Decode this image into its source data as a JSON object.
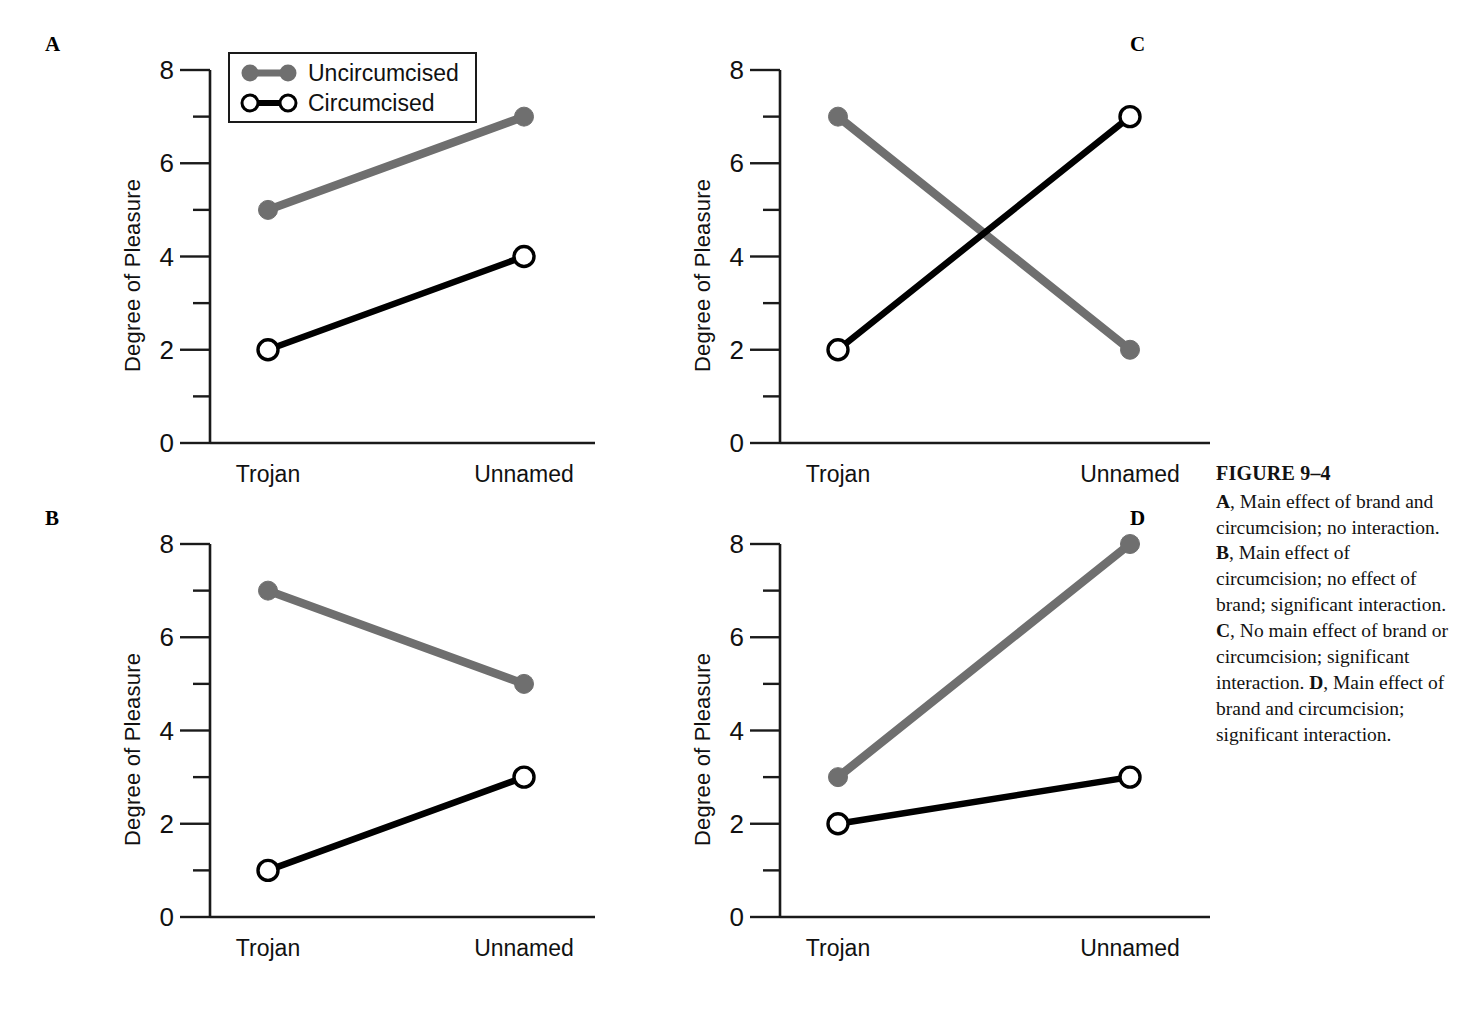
{
  "figure": {
    "caption_title": "FIGURE 9–4",
    "caption_items": [
      {
        "letter": "A",
        "text": ", Main effect of brand and circumcision; no interaction."
      },
      {
        "letter": "B",
        "text": ", Main effect of circumcision; no effect of brand; significant interaction."
      },
      {
        "letter": "C",
        "text": ", No main effect of brand or circumcision; significant interaction."
      },
      {
        "letter": "D",
        "text": ", Main effect of brand and circumcision; significant interaction."
      }
    ]
  },
  "legend": {
    "position": "top-left-inside-panel-A",
    "entries": [
      {
        "label": "Uncircumcised",
        "marker": "filled-circle",
        "color": "#6f6f6f"
      },
      {
        "label": "Circumcised",
        "marker": "open-circle",
        "color": "#000000"
      }
    ]
  },
  "colors": {
    "uncircumcised": "#6f6f6f",
    "circumcised": "#000000",
    "axis": "#1a1a1a",
    "background": "#ffffff"
  },
  "chart_data": [
    {
      "panel": "A",
      "type": "line",
      "title": "",
      "xlabel": "",
      "ylabel": "Degree of Pleasure",
      "categories": [
        "Trojan",
        "Unnamed"
      ],
      "ylim": [
        0,
        8
      ],
      "yticks": [
        0,
        2,
        4,
        6,
        8
      ],
      "yticks_minor": [
        1,
        3,
        5,
        7
      ],
      "grid": false,
      "legend_position": "upper left",
      "series": [
        {
          "name": "Uncircumcised",
          "values": [
            5,
            7
          ],
          "color": "#6f6f6f",
          "marker": "filled-circle"
        },
        {
          "name": "Circumcised",
          "values": [
            2,
            4
          ],
          "color": "#000000",
          "marker": "open-circle"
        }
      ]
    },
    {
      "panel": "B",
      "type": "line",
      "title": "",
      "xlabel": "",
      "ylabel": "Degree of Pleasure",
      "categories": [
        "Trojan",
        "Unnamed"
      ],
      "ylim": [
        0,
        8
      ],
      "yticks": [
        0,
        2,
        4,
        6,
        8
      ],
      "yticks_minor": [
        1,
        3,
        5,
        7
      ],
      "grid": false,
      "legend_position": "none",
      "series": [
        {
          "name": "Uncircumcised",
          "values": [
            7,
            5
          ],
          "color": "#6f6f6f",
          "marker": "filled-circle"
        },
        {
          "name": "Circumcised",
          "values": [
            1,
            3
          ],
          "color": "#000000",
          "marker": "open-circle"
        }
      ]
    },
    {
      "panel": "C",
      "type": "line",
      "title": "",
      "xlabel": "",
      "ylabel": "Degree of Pleasure",
      "categories": [
        "Trojan",
        "Unnamed"
      ],
      "ylim": [
        0,
        8
      ],
      "yticks": [
        0,
        2,
        4,
        6,
        8
      ],
      "yticks_minor": [
        1,
        3,
        5,
        7
      ],
      "grid": false,
      "legend_position": "none",
      "series": [
        {
          "name": "Uncircumcised",
          "values": [
            7,
            2
          ],
          "color": "#6f6f6f",
          "marker": "filled-circle"
        },
        {
          "name": "Circumcised",
          "values": [
            2,
            7
          ],
          "color": "#000000",
          "marker": "open-circle"
        }
      ]
    },
    {
      "panel": "D",
      "type": "line",
      "title": "",
      "xlabel": "",
      "ylabel": "Degree of Pleasure",
      "categories": [
        "Trojan",
        "Unnamed"
      ],
      "ylim": [
        0,
        8
      ],
      "yticks": [
        0,
        2,
        4,
        6,
        8
      ],
      "yticks_minor": [
        1,
        3,
        5,
        7
      ],
      "grid": false,
      "legend_position": "none",
      "series": [
        {
          "name": "Uncircumcised",
          "values": [
            3,
            8
          ],
          "color": "#6f6f6f",
          "marker": "filled-circle"
        },
        {
          "name": "Circumcised",
          "values": [
            2,
            3
          ],
          "color": "#000000",
          "marker": "open-circle"
        }
      ]
    }
  ]
}
